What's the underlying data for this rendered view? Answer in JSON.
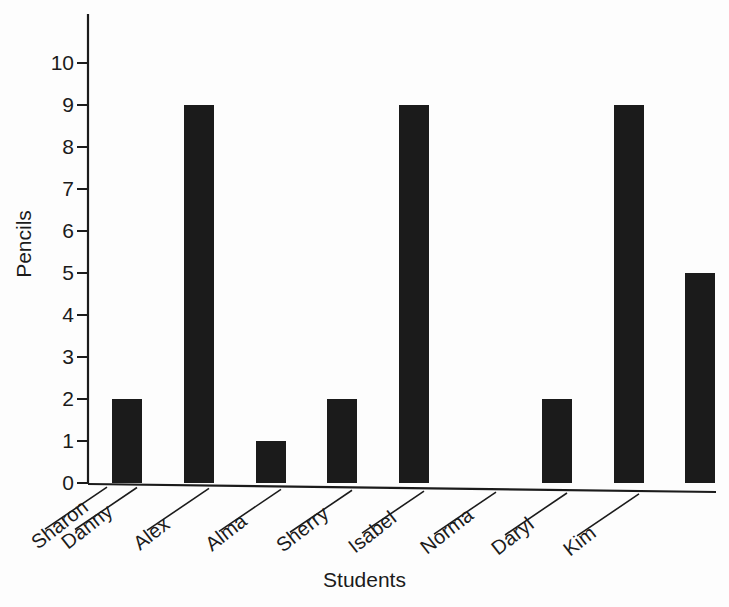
{
  "chart_data": {
    "type": "bar",
    "title": "",
    "subtitle": "",
    "xlabel": "Students",
    "ylabel": "Pencils",
    "categories": [
      "Sharon",
      "Danny",
      "Alex",
      "Alma",
      "Sherry",
      "Isabel",
      "Norma",
      "Daryl",
      "Kim"
    ],
    "values": [
      0,
      2,
      9,
      1,
      2,
      9,
      0,
      2,
      9
    ],
    "extra_bar_value": 5,
    "ylim": [
      0,
      10
    ],
    "yticks": [
      0,
      1,
      2,
      3,
      4,
      5,
      6,
      7,
      8,
      9,
      10
    ],
    "ytick_labels": [
      "0",
      "1",
      "2",
      "3",
      "4",
      "5",
      "6",
      "7",
      "8",
      "9",
      "10"
    ],
    "grid": false,
    "legend": "none",
    "bar_color": "#1b1b1b",
    "axis_color": "#1b1b1b",
    "background_color": "#fdfdfd"
  },
  "axes": {
    "y_title": "Pencils",
    "x_title": "Students"
  },
  "ytick_labels": [
    "0",
    "1",
    "2",
    "3",
    "4",
    "5",
    "6",
    "7",
    "8",
    "9",
    "10"
  ],
  "categories": [
    "Sharon",
    "Danny",
    "Alex",
    "Alma",
    "Sherry",
    "Isabel",
    "Norma",
    "Daryl",
    "Kim"
  ]
}
